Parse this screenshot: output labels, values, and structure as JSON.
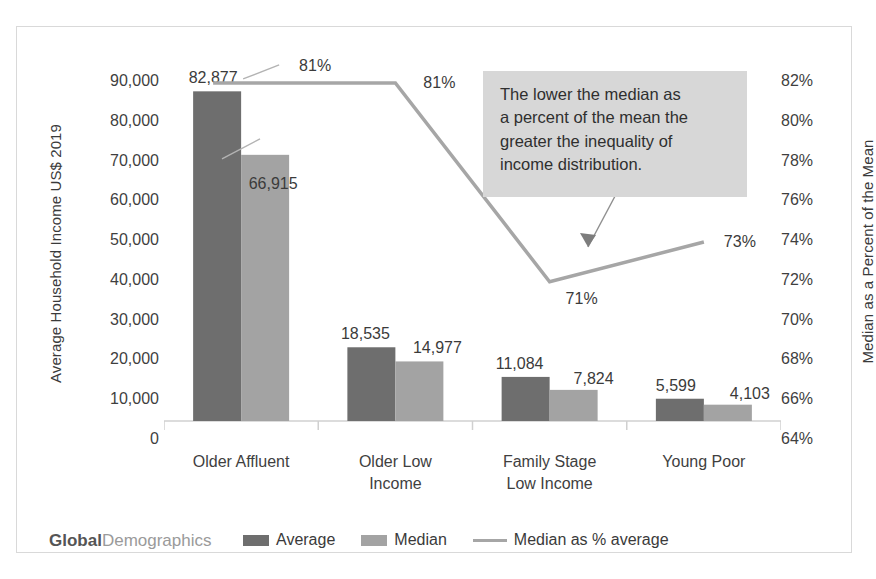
{
  "chart_data": {
    "type": "bar",
    "title": "",
    "subtitle": "",
    "categories": [
      "Older Affluent",
      "Older Low Income",
      "Family Stage Low Income",
      "Young Poor"
    ],
    "category_lines": [
      [
        "Older Affluent"
      ],
      [
        "Older Low",
        "Income"
      ],
      [
        "Family Stage",
        "Low Income"
      ],
      [
        "Young Poor"
      ]
    ],
    "series": [
      {
        "name": "Average",
        "type": "bar",
        "axis": "left",
        "color": "#6e6e6e",
        "values": [
          82877,
          18535,
          11084,
          5599
        ],
        "labels": [
          "82,877",
          "18,535",
          "11,084",
          "5,599"
        ]
      },
      {
        "name": "Median",
        "type": "bar",
        "axis": "left",
        "color": "#a3a3a3",
        "values": [
          66915,
          14977,
          7824,
          4103
        ],
        "labels": [
          "66,915",
          "14,977",
          "7,824",
          "4,103"
        ]
      },
      {
        "name": "Median as % average",
        "type": "line",
        "axis": "right",
        "color": "#a6a6a6",
        "values": [
          81,
          81,
          71,
          73
        ],
        "labels": [
          "81%",
          "81%",
          "71%",
          "73%"
        ]
      }
    ],
    "xlabel": "",
    "ylabel": "Average Household Income US$ 2019",
    "y2label": "Median as a Percent of the Mean",
    "ylim": [
      0,
      90000
    ],
    "y2lim": [
      64,
      82
    ],
    "yticks": [
      "0",
      "10,000",
      "20,000",
      "30,000",
      "40,000",
      "50,000",
      "60,000",
      "70,000",
      "80,000",
      "90,000"
    ],
    "ytick_values": [
      0,
      10000,
      20000,
      30000,
      40000,
      50000,
      60000,
      70000,
      80000,
      90000
    ],
    "y2ticks": [
      "64%",
      "66%",
      "68%",
      "70%",
      "72%",
      "74%",
      "76%",
      "78%",
      "80%",
      "82%"
    ],
    "y2tick_values": [
      64,
      66,
      68,
      70,
      72,
      74,
      76,
      78,
      80,
      82
    ],
    "grid": false,
    "legend_position": "bottom",
    "annotations": [
      {
        "name": "inequality-note",
        "text": "The lower the median as a percent of the mean the greater the inequality of income distribution.",
        "points_to": "Median as % average line"
      }
    ]
  },
  "axes": {
    "left_title": "Average Household Income US$ 2019",
    "right_title": "Median as a Percent of the Mean"
  },
  "callout": {
    "line1": "The lower the median as",
    "line2": "a percent of the mean the",
    "line3": "greater the inequality of",
    "line4": "income distribution."
  },
  "legend": {
    "items": [
      {
        "label": "Average",
        "marker": "bar",
        "color": "#6e6e6e"
      },
      {
        "label": "Median",
        "marker": "bar",
        "color": "#a3a3a3"
      },
      {
        "label": "Median as % average",
        "marker": "line",
        "color": "#a6a6a6"
      }
    ]
  },
  "brand": {
    "part1": "Global",
    "part2": "Demographics"
  },
  "colors": {
    "average_bar": "#6e6e6e",
    "median_bar": "#a3a3a3",
    "percent_line": "#a6a6a6",
    "callout_bg": "#d7d7d7",
    "frame_border": "#d9d9d9",
    "axis_line": "#d0d0d0",
    "text": "#3f3f3f"
  }
}
